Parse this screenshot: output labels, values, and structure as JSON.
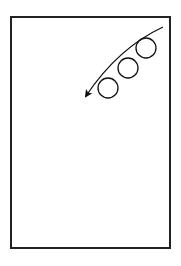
{
  "diagram": {
    "frame": {
      "x": 11,
      "y": 17,
      "width": 159,
      "height": 231,
      "stroke": "#222222"
    },
    "circles": [
      {
        "cx": 146,
        "cy": 48,
        "r": 10
      },
      {
        "cx": 128,
        "cy": 68,
        "r": 10
      },
      {
        "cx": 108,
        "cy": 88,
        "r": 10
      }
    ],
    "arrow": {
      "path": "M163,27 Q118,48 86,96",
      "tip": {
        "x": 82,
        "y": 100
      },
      "direction": "down-left",
      "color": "#111111"
    }
  }
}
